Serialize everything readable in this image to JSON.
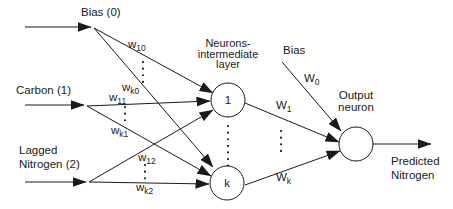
{
  "diagram_type": "neural-network-architecture",
  "colors": {
    "line": "#1a1a1a",
    "text": "#1a1a1a",
    "background": "#ffffff"
  },
  "inputs": {
    "bias": {
      "label": "Bias (0)"
    },
    "carbon": {
      "label": "Carbon (1)"
    },
    "nitrogen": {
      "line1": "Lagged",
      "line2": "Nitrogen (2)"
    }
  },
  "hidden_layer": {
    "title": {
      "line1": "Neurons-",
      "line2": "intermediate",
      "line3": "layer"
    },
    "neuron_first": "1",
    "neuron_last": "k",
    "weights": {
      "w10": {
        "base": "w",
        "sub": "10"
      },
      "wk0": {
        "base": "w",
        "sub": "k0"
      },
      "w11": {
        "base": "w",
        "sub": "11"
      },
      "wk1": {
        "base": "w",
        "sub": "k1"
      },
      "w12": {
        "base": "w",
        "sub": "12"
      },
      "wk2": {
        "base": "w",
        "sub": "k2"
      }
    }
  },
  "output_layer": {
    "bias_label": "Bias",
    "title": {
      "line1": "Output",
      "line2": "neuron"
    },
    "weights": {
      "w0": {
        "base": "W",
        "sub": "0"
      },
      "w1": {
        "base": "W",
        "sub": "1"
      },
      "wk": {
        "base": "W",
        "sub": "k"
      }
    },
    "prediction": {
      "line1": "Predicted",
      "line2": "Nitrogen"
    }
  }
}
